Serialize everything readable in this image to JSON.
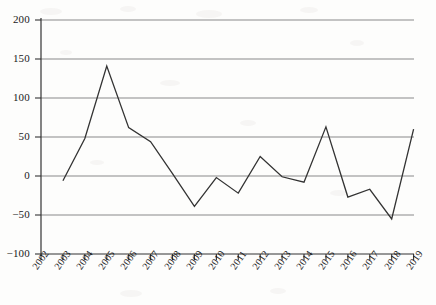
{
  "chart_data": {
    "type": "line",
    "title": "",
    "subtitle": "",
    "xlabel": "",
    "ylabel": "",
    "x": [
      2002,
      2003,
      2004,
      2005,
      2006,
      2007,
      2008,
      2009,
      2010,
      2011,
      2012,
      2013,
      2014,
      2015,
      2016,
      2017,
      2018,
      2019
    ],
    "categories": [
      "2002",
      "2003",
      "2004",
      "2005",
      "2006",
      "2007",
      "2008",
      "2009",
      "2010",
      "2011",
      "2012",
      "2013",
      "2014",
      "2015",
      "2016",
      "2017",
      "2018",
      "2019"
    ],
    "series": [
      {
        "name": "",
        "x": [
          2003,
          2004,
          2005,
          2006,
          2007,
          2008,
          2009,
          2010,
          2011,
          2012,
          2013,
          2014,
          2015,
          2016,
          2017,
          2018,
          2019
        ],
        "values": [
          -6,
          48,
          141,
          62,
          44,
          3,
          -39,
          -2,
          -22,
          25,
          -1,
          -8,
          63,
          -27,
          -17,
          -55,
          60
        ]
      }
    ],
    "xlim": [
      2002,
      2019
    ],
    "ylim": [
      -100,
      200
    ],
    "yticks": [
      -100,
      -50,
      0,
      50,
      100,
      150,
      200
    ],
    "ytick_labels": [
      "−100",
      "−50",
      "0",
      "50",
      "100",
      "150",
      "200"
    ],
    "xticks": [
      2002,
      2003,
      2004,
      2005,
      2006,
      2007,
      2008,
      2009,
      2010,
      2011,
      2012,
      2013,
      2014,
      2015,
      2016,
      2017,
      2018,
      2019
    ],
    "xtick_labels": [
      "2002",
      "2003",
      "2004",
      "2005",
      "2006",
      "2007",
      "2008",
      "2009",
      "2010",
      "2011",
      "2012",
      "2013",
      "2014",
      "2015",
      "2016",
      "2017",
      "2018",
      "2019"
    ],
    "grid": true,
    "grid_axis": "y",
    "legend": false,
    "legend_position": "none",
    "line_color": "#333333",
    "grid_color": "#8a8a8a",
    "axis_color": "#333333",
    "background_color": "#fdfdfc"
  }
}
